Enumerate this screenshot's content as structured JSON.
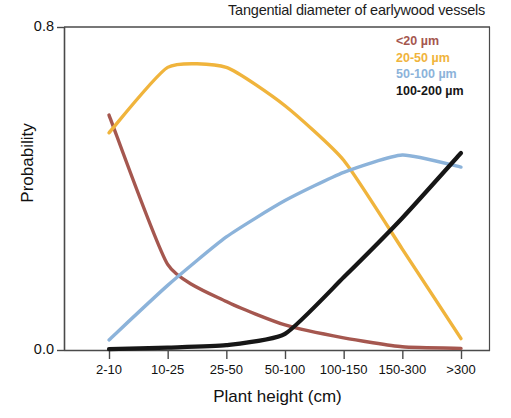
{
  "chart_data": {
    "type": "line",
    "title": "Tangential diameter of earlywood vessels",
    "xlabel": "Plant height (cm)",
    "ylabel": "Probability",
    "categories": [
      "2-10",
      "10-25",
      "25-50",
      "50-100",
      "100-150",
      "150-300",
      ">300"
    ],
    "ylim": [
      0.0,
      0.8
    ],
    "yticks": [
      "0.0",
      "0.8"
    ],
    "ytick_values": [
      0.0,
      0.8
    ],
    "grid": false,
    "legend_position": "top-right inside",
    "series": [
      {
        "name": "<20 µm",
        "color": "#a5574f",
        "values": [
          0.582,
          0.212,
          0.12,
          0.062,
          0.03,
          0.008,
          0.004
        ]
      },
      {
        "name": "20-50 µm",
        "color": "#f0b43c",
        "values": [
          0.538,
          0.7,
          0.7,
          0.605,
          0.47,
          0.25,
          0.028
        ]
      },
      {
        "name": "50-100 µm",
        "color": "#8cb3da",
        "values": [
          0.025,
          0.16,
          0.28,
          0.37,
          0.44,
          0.483,
          0.453
        ]
      },
      {
        "name": "100-200 µm",
        "color": "#161616",
        "values": [
          0.002,
          0.006,
          0.012,
          0.04,
          0.18,
          0.327,
          0.488
        ]
      }
    ]
  },
  "legend": {
    "entries": [
      {
        "label": "<20 µm",
        "color": "#a5574f"
      },
      {
        "label": "20-50 µm",
        "color": "#f0b43c"
      },
      {
        "label": "50-100 µm",
        "color": "#8cb3da"
      },
      {
        "label": "100-200 µm",
        "color": "#161616"
      }
    ]
  },
  "axes": {
    "y_top_label": "0.8",
    "y_bottom_label": "0.0",
    "axis_color": "#4a4a4a"
  }
}
